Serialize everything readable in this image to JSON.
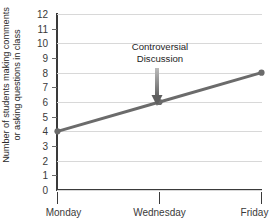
{
  "chart_data": {
    "type": "line",
    "title": "",
    "xlabel": "",
    "ylabel": "Number of students making comments or asking questions in class",
    "ylabel_lines": [
      "Number of students making comments",
      "or asking questions in class"
    ],
    "categories": [
      "Monday",
      "Wednesday",
      "Friday"
    ],
    "values": [
      4,
      6,
      8
    ],
    "series": [
      {
        "name": "Number of students making comments or asking questions in class",
        "values": [
          4,
          6,
          8
        ]
      }
    ],
    "ylim": [
      0,
      12
    ],
    "y_ticks": [
      0,
      1,
      2,
      3,
      4,
      5,
      6,
      7,
      8,
      9,
      10,
      11,
      12
    ],
    "y_tick_labels": [
      "0",
      "1",
      "2",
      "3",
      "4",
      "5",
      "6",
      "7",
      "8",
      "9",
      "10",
      "11",
      "12"
    ],
    "gridline_values": [
      0,
      2,
      4,
      6,
      8,
      10,
      12
    ],
    "minor_tick_values": [
      1,
      3,
      5,
      7,
      9,
      11
    ],
    "grid": true,
    "legend": false,
    "legend_position": "none",
    "annotations": [
      {
        "text": "Controversial Discussion",
        "lines": [
          "Controversial",
          "Discussion"
        ],
        "points_to_category": "Wednesday",
        "points_to_value": 6,
        "arrow": "down-arrow"
      }
    ],
    "colors": {
      "line": "#6b6b6b",
      "marker": "#6b6b6b",
      "grid": "#d8d8d8",
      "axis": "#3a3a3a",
      "text": "#2b2b2b",
      "arrow": "#7a7a7a",
      "background": "#ffffff"
    },
    "marker": "circle",
    "line_width_px": 3
  }
}
